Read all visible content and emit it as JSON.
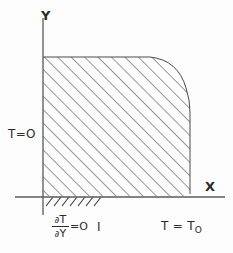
{
  "figure": {
    "background_color": "#fdfdfd",
    "ink_color": "#2b2b2b",
    "axes": {
      "y_label": "Y",
      "x_label": "X",
      "origin": [
        43,
        197
      ],
      "x_axis_span": [
        15,
        225
      ],
      "y_axis_span": [
        18,
        215
      ]
    },
    "labels": {
      "left_boundary": "T=O",
      "right_boundary_text": "T = T",
      "right_boundary_subscript": "O",
      "bottom_boundary_numerator_partial": "∂",
      "bottom_boundary_numerator_var": "T",
      "bottom_boundary_denominator_partial": "∂",
      "bottom_boundary_denominator_var": "Y",
      "bottom_boundary_equals": "=O",
      "bottom_tick": "I"
    },
    "region": {
      "fill": "diagonal-hatching",
      "hatch_angle_degrees": 45,
      "hatch_spacing_px": 9.5,
      "top_edge_y": 57,
      "left_edge_x": 43,
      "right_edge_x": 190,
      "bottom_edge_y": 196,
      "corner": "rounded-top-right",
      "corner_start": [
        150,
        57
      ],
      "corner_end": [
        190,
        110
      ]
    },
    "bottom_hatch_ticks": {
      "count": 7,
      "x_start": 46,
      "x_end": 100,
      "y": 197,
      "length": 9
    }
  }
}
